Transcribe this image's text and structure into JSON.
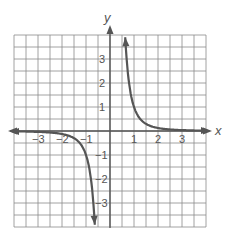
{
  "chart_data": {
    "type": "line",
    "title": "",
    "function": "y = 1/x^3",
    "xlabel": "x",
    "ylabel": "y",
    "xlim": [
      -4,
      4
    ],
    "ylim": [
      -4,
      4
    ],
    "grid": true,
    "grid_step": 0.5,
    "x_ticks": [
      {
        "value": -3,
        "label": "−3"
      },
      {
        "value": -2,
        "label": "−2"
      },
      {
        "value": -1,
        "label": "−1"
      },
      {
        "value": 1,
        "label": "1"
      },
      {
        "value": 2,
        "label": "2"
      },
      {
        "value": 3,
        "label": "3"
      }
    ],
    "y_ticks": [
      {
        "value": 3,
        "label": "3"
      },
      {
        "value": 2,
        "label": "2"
      },
      {
        "value": 1,
        "label": "1"
      },
      {
        "value": -1,
        "label": "−1"
      },
      {
        "value": -2,
        "label": "−2"
      },
      {
        "value": -3,
        "label": "−3"
      }
    ],
    "series": [
      {
        "name": "right-branch",
        "x": [
          0.63,
          0.7,
          0.8,
          1.0,
          1.25,
          1.5,
          2.0,
          2.5,
          3.0,
          3.5,
          4.0
        ],
        "y": [
          4.0,
          2.92,
          1.95,
          1.0,
          0.51,
          0.3,
          0.125,
          0.064,
          0.037,
          0.023,
          0.016
        ]
      },
      {
        "name": "left-branch",
        "x": [
          -4.0,
          -3.5,
          -3.0,
          -2.5,
          -2.0,
          -1.5,
          -1.25,
          -1.0,
          -0.8,
          -0.7,
          -0.63
        ],
        "y": [
          -0.016,
          -0.023,
          -0.037,
          -0.064,
          -0.125,
          -0.3,
          -0.51,
          -1.0,
          -1.95,
          -2.92,
          -4.0
        ]
      }
    ],
    "legend": []
  },
  "labels": {
    "x_axis": "x",
    "y_axis": "y"
  }
}
